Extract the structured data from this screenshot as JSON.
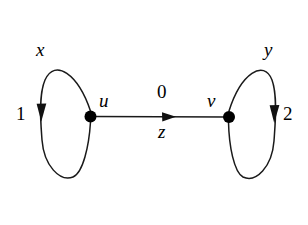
{
  "figure": {
    "type": "directed-graph",
    "background_color": "#ffffff",
    "stroke_color": "#1a1a1a",
    "node_fill_color": "#000000",
    "nodes": [
      {
        "id": "u",
        "label": "u",
        "x": 90,
        "y": 116,
        "radius": 5.5
      },
      {
        "id": "v",
        "label": "v",
        "x": 229,
        "y": 117,
        "radius": 5.5
      }
    ],
    "edges": [
      {
        "id": "loop-left",
        "kind": "self-loop",
        "from": "u",
        "to": "u",
        "name_label": "x",
        "weight_label": "1",
        "direction": "down",
        "side": "left"
      },
      {
        "id": "edge-uv",
        "kind": "straight",
        "from": "u",
        "to": "v",
        "top_label": "0",
        "bottom_label": "z",
        "direction": "right"
      },
      {
        "id": "loop-right",
        "kind": "self-loop",
        "from": "v",
        "to": "v",
        "name_label": "y",
        "weight_label": "2",
        "direction": "down",
        "side": "right"
      }
    ]
  }
}
